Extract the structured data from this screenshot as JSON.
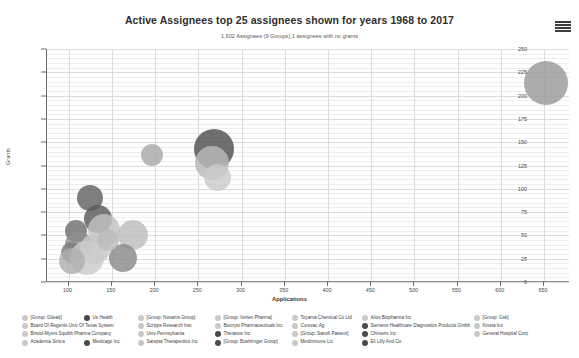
{
  "header": {
    "title": "Active Assignees top 25 assignees shown for years 1968 to 2017",
    "subtitle": "1,602 Assignees (9 Groups),1 assignees with no grants",
    "menu_icon": "hamburger-menu-icon"
  },
  "chart_data": {
    "type": "scatter",
    "title": "Active Assignees top 25 assignees shown for years 1968 to 2017",
    "subtitle": "1,602 Assignees (9 Groups),1 assignees with no grants",
    "xlabel": "Applications",
    "ylabel": "Grants",
    "xlim": [
      75,
      680
    ],
    "ylim": [
      0,
      250
    ],
    "xticks": [
      100,
      150,
      200,
      250,
      300,
      350,
      400,
      450,
      500,
      550,
      600,
      650
    ],
    "yticks": [
      0,
      25,
      50,
      75,
      100,
      125,
      150,
      175,
      200,
      225,
      250
    ],
    "grid": true,
    "legend_position": "bottom",
    "points": [
      {
        "name": "[Group: Gsk]",
        "x": 652,
        "y": 213,
        "size": 44,
        "color": "#9a9a9a"
      },
      {
        "name": "[Group: Gilead]",
        "x": 268,
        "y": 143,
        "size": 40,
        "color": "#4f4f4f"
      },
      {
        "name": "[Group: Novartis Group]",
        "x": 266,
        "y": 128,
        "size": 34,
        "color": "#b9b9b9"
      },
      {
        "name": "[Group: Vertex Pharma]",
        "x": 196,
        "y": 136,
        "size": 22,
        "color": "#a8a8a8"
      },
      {
        "name": "Us Health",
        "x": 125,
        "y": 90,
        "size": 26,
        "color": "#616161"
      },
      {
        "name": "[Group: Sanofi Pasteur]",
        "x": 134,
        "y": 68,
        "size": 28,
        "color": "#5a5a5a"
      },
      {
        "name": "[Group: Boehringer Group]",
        "x": 141,
        "y": 56,
        "size": 32,
        "color": "#c2c2c2"
      },
      {
        "name": "Board Of Regents Univ Of Texas System",
        "x": 108,
        "y": 55,
        "size": 22,
        "color": "#6f6f6f"
      },
      {
        "name": "Scripps Research Inst",
        "x": 112,
        "y": 40,
        "size": 27,
        "color": "#8f8f8f"
      },
      {
        "name": "Biocryst Pharmaceuticals Inc",
        "x": 103,
        "y": 32,
        "size": 21,
        "color": "#7c7c7c"
      },
      {
        "name": "Toyama Chemical Co Ltd",
        "x": 131,
        "y": 35,
        "size": 30,
        "color": "#c8c8c8"
      },
      {
        "name": "Alios Biopharma Inc",
        "x": 121,
        "y": 26,
        "size": 34,
        "color": "#cccccc"
      },
      {
        "name": "Kineta Inc",
        "x": 104,
        "y": 22,
        "size": 26,
        "color": "#b0b0b0"
      },
      {
        "name": "Bristol-Myers Squibb Pharma Company",
        "x": 175,
        "y": 50,
        "size": 30,
        "color": "#bdbdbd"
      },
      {
        "name": "Univ Pennsylvania",
        "x": 163,
        "y": 26,
        "size": 28,
        "color": "#8a8a8a"
      },
      {
        "name": "Curevac Ag",
        "x": 145,
        "y": 45,
        "size": 22,
        "color": "#bcbcbc"
      },
      {
        "name": "Siemens Healthcare Diagnostics Products Gmbh",
        "x": 272,
        "y": 112,
        "size": 27,
        "color": "#cacaca"
      }
    ]
  },
  "axes": {
    "y_title": "Grants",
    "x_title": "Applications",
    "y_tick_labels": [
      "250",
      "225",
      "200",
      "175",
      "150",
      "125",
      "100",
      "75",
      "50",
      "25",
      "0"
    ],
    "x_tick_labels": [
      "100",
      "150",
      "200",
      "250",
      "300",
      "350",
      "400",
      "450",
      "500",
      "550",
      "600",
      "650"
    ]
  },
  "legend": {
    "columns": [
      {
        "items": [
          "[Group: Gilead]",
          "Board Of Regents Univ Of Texas System",
          "Bristol-Myers Squibb Pharma Company",
          "Academia Sinica"
        ]
      },
      {
        "items": [
          "Us Health",
          "",
          "",
          "Medicago Inc"
        ]
      },
      {
        "items": [
          "[Group: Novartis Group]",
          "Scripps Research Inst",
          "Univ Pennsylvania",
          "Sarepta Therapeutics Inc"
        ]
      },
      {
        "items": [
          "[Group: Vertex Pharma]",
          "Biocryst Pharmaceuticals Inc",
          "Theranos Inc",
          "[Group: Boehringer Group]"
        ]
      },
      {
        "items": [
          "Toyama Chemical Co Ltd",
          "Curevac Ag",
          "[Group: Sanofi Pasteur]",
          "Medimmune Llc"
        ]
      },
      {
        "items": [
          "Alios Biopharma Inc",
          "Siemens Healthcare Diagnostics Products Gmbh",
          "Chimerix Inc",
          "Eli Lilly And Co"
        ]
      },
      {
        "items": [
          "[Group: Gsk]",
          "Kineta Inc",
          "General Hospital Corp"
        ]
      }
    ],
    "swatch_color": "#c9c9c9",
    "swatch_color_dark": "#4a4a4a"
  },
  "colors": {
    "background": "#ffffff",
    "gridline": "#dcdcdc",
    "gridline_minor": "#eeeeee",
    "axis": "#6b6b6b",
    "text": "#3a3a3a"
  }
}
